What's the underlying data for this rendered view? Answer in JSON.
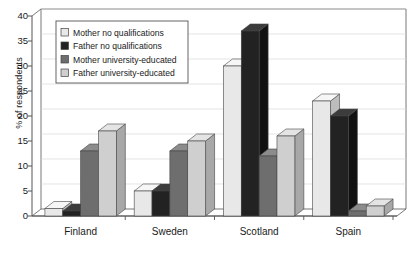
{
  "figure": {
    "clipped_title": "",
    "y_axis": {
      "label": "% of respondents",
      "ticks": [
        "0",
        "5",
        "10",
        "15",
        "20",
        "25",
        "30",
        "35",
        "40"
      ],
      "min": 0,
      "max": 40,
      "step": 5
    },
    "legend": {
      "items": [
        {
          "label": "Mother no qualifications",
          "color": "#e8e8e8"
        },
        {
          "label": "Father no qualifications",
          "color": "#222222"
        },
        {
          "label": "Mother university-educated",
          "color": "#6e6e6e"
        },
        {
          "label": "Father university-educated",
          "color": "#cfcfcf"
        }
      ]
    },
    "x_axis": {
      "categories": [
        "Finland",
        "Sweden",
        "Scotland",
        "Spain"
      ]
    },
    "style": {
      "bar_face_colors": [
        "#e8e8e8",
        "#222222",
        "#6e6e6e",
        "#cfcfcf"
      ],
      "bar_top_colors": [
        "#f6f6f6",
        "#3c3c3c",
        "#8c8c8c",
        "#e4e4e4"
      ],
      "bar_side_colors": [
        "#bdbdbd",
        "#111111",
        "#555555",
        "#a8a8a8"
      ],
      "grid_color": "#d9d9d9",
      "axis_color": "#555555",
      "floor_color": "#ffffff",
      "text_color": "#1a1a1a"
    }
  },
  "chart_data": {
    "type": "bar",
    "title": "",
    "xlabel": "",
    "ylabel": "% of respondents",
    "ylim": [
      0,
      40
    ],
    "grid": true,
    "legend_position": "upper-left-inside",
    "categories": [
      "Finland",
      "Sweden",
      "Scotland",
      "Spain"
    ],
    "series": [
      {
        "name": "Mother no qualifications",
        "values": [
          1.5,
          5,
          30,
          23
        ]
      },
      {
        "name": "Father no qualifications",
        "values": [
          1,
          5,
          37,
          20
        ]
      },
      {
        "name": "Mother university-educated",
        "values": [
          13,
          13,
          12,
          1
        ]
      },
      {
        "name": "Father university-educated",
        "values": [
          17,
          15,
          16,
          2
        ]
      }
    ]
  }
}
